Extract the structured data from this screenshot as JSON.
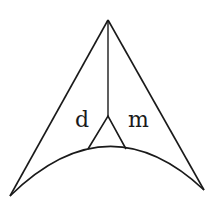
{
  "diagram": {
    "type": "geometric-figure",
    "labels": {
      "left": "d",
      "right": "m"
    },
    "stroke_color": "#1a1a1a",
    "background": "#ffffff"
  }
}
